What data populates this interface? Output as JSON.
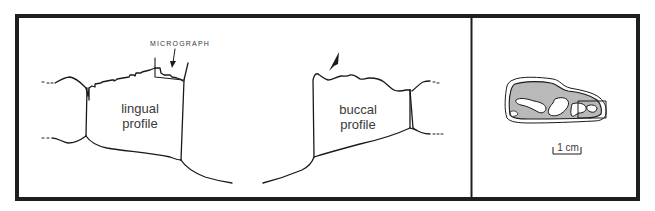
{
  "figure": {
    "panels": [
      {
        "id": "profiles",
        "labels": {
          "lingual_line1": "lingual",
          "lingual_line2": "profile",
          "buccal_line1": "buccal",
          "buccal_line2": "profile",
          "micrograph": "MICROGRAPH"
        }
      },
      {
        "id": "occlusal-view",
        "labels": {
          "scale_bar": "1 cm"
        }
      }
    ],
    "colors": {
      "frame": "#1e1e1e",
      "line": "#1a1a1a",
      "text": "#3a3a3a",
      "stipple_fill": "#b9b9b9",
      "background": "#ffffff"
    }
  }
}
